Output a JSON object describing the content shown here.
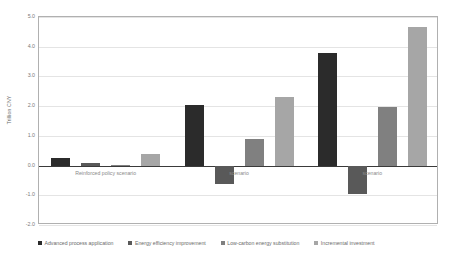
{
  "chart_data": {
    "type": "bar",
    "title": "",
    "xlabel": "",
    "ylabel": "Trillion CNY",
    "ylim": [
      -2.0,
      5.0
    ],
    "ytick_step": 1.0,
    "yticks": [
      "5.0",
      "4.0",
      "3.0",
      "2.0",
      "1.0",
      "0.0",
      "-1.0",
      "-2.0"
    ],
    "ytick_values": [
      5.0,
      4.0,
      3.0,
      2.0,
      1.0,
      0.0,
      -1.0,
      -2.0
    ],
    "grid": true,
    "legend_position": "bottom",
    "categories": [
      "Reinforced policy scenario",
      "scenario",
      "scenario"
    ],
    "series": [
      {
        "name": "Advanced process application",
        "color": "#2b2b2b",
        "values": [
          0.27,
          2.05,
          3.8
        ]
      },
      {
        "name": "Energy efficiency improvement",
        "color": "#595959",
        "values": [
          0.07,
          -0.62,
          -0.95
        ]
      },
      {
        "name": "Low-carbon energy substitution",
        "color": "#808080",
        "values": [
          0.03,
          0.9,
          1.98
        ]
      },
      {
        "name": "Incremental investment",
        "color": "#a6a6a6",
        "values": [
          0.4,
          2.32,
          4.65
        ]
      }
    ]
  },
  "axis": {
    "y_title": "Trillion CNY"
  }
}
